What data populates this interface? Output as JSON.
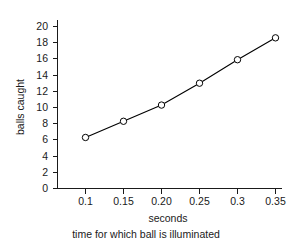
{
  "chart_data": {
    "type": "line",
    "title": "",
    "subtitle": "",
    "xlabel": "seconds",
    "ylabel": "balls caught",
    "caption": "time for which ball is illuminated",
    "x": [
      0.1,
      0.15,
      0.2,
      0.25,
      0.3,
      0.35
    ],
    "values": [
      6.3,
      8.3,
      10.3,
      13.0,
      15.9,
      18.6
    ],
    "series": [
      {
        "name": "balls caught",
        "values": [
          6.3,
          8.3,
          10.3,
          13.0,
          15.9,
          18.6
        ],
        "marker": "open-circle",
        "color": "#000000"
      }
    ],
    "xtick_labels": [
      "0.1",
      "0.15",
      "0.20",
      "0.25",
      "0.3",
      "0.35"
    ],
    "xtick_values": [
      0.1,
      0.15,
      0.2,
      0.25,
      0.3,
      0.35
    ],
    "ytick_labels": [
      "0",
      "2",
      "4",
      "6",
      "8",
      "10",
      "12",
      "14",
      "16",
      "18",
      "20"
    ],
    "ytick_values": [
      0,
      2,
      4,
      6,
      8,
      10,
      12,
      14,
      16,
      18,
      20
    ],
    "xlim": [
      0.075,
      0.375
    ],
    "ylim": [
      0,
      21
    ],
    "grid": false,
    "legend": false,
    "legend_position": "none"
  },
  "axes": {
    "y_axis_title": "balls caught",
    "x_axis_title": "seconds"
  },
  "captions": {
    "x_caption": "seconds",
    "figure_caption": "time for which ball is illuminated"
  },
  "colors": {
    "line": "#000000",
    "marker_fill": "#ffffff",
    "axis": "#1a1a1a",
    "background": "#ffffff"
  }
}
